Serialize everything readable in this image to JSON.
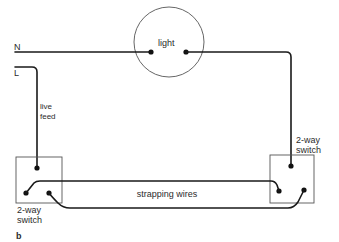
{
  "diagram": {
    "type": "two-way light switch wiring",
    "labels": {
      "neutral": "N",
      "live": "L",
      "light": "light",
      "live_feed_line1": "live",
      "live_feed_line2": "feed",
      "left_switch_line1": "2-way",
      "left_switch_line2": "switch",
      "right_switch_line1": "2-way",
      "right_switch_line2": "switch",
      "strapping": "strapping wires",
      "figure_letter": "b"
    },
    "colors": {
      "wire": "#1a1a1a",
      "outline": "#555555",
      "text": "#2b2b2b",
      "background": "#ffffff"
    }
  }
}
